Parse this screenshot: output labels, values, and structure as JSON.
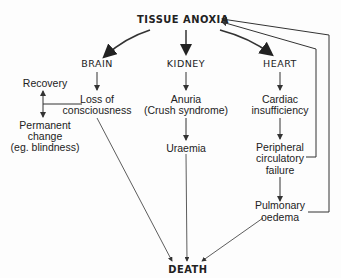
{
  "diagram": {
    "top": "TISSUE ANOXIA",
    "bottom": "DEATH",
    "columns": {
      "brain": {
        "header": "BRAIN",
        "step1_l1": "Loss of",
        "step1_l2": "consciousness"
      },
      "kidney": {
        "header": "KIDNEY",
        "step1_l1": "Anuria",
        "step1_l2": "(Crush syndrome)",
        "step2": "Uraemia"
      },
      "heart": {
        "header": "HEART",
        "step1_l1": "Cardiac",
        "step1_l2": "insufficiency",
        "step2_l1": "Peripheral",
        "step2_l2": "circulatory",
        "step2_l3": "failure",
        "step3_l1": "Pulmonary",
        "step3_l2": "oedema"
      }
    },
    "side": {
      "recovery": "Recovery",
      "permanent_l1": "Permanent",
      "permanent_l2": "change",
      "permanent_l3": "(eg. blindness)"
    },
    "colors": {
      "line": "#333333",
      "background": "#fdfdfd"
    }
  }
}
